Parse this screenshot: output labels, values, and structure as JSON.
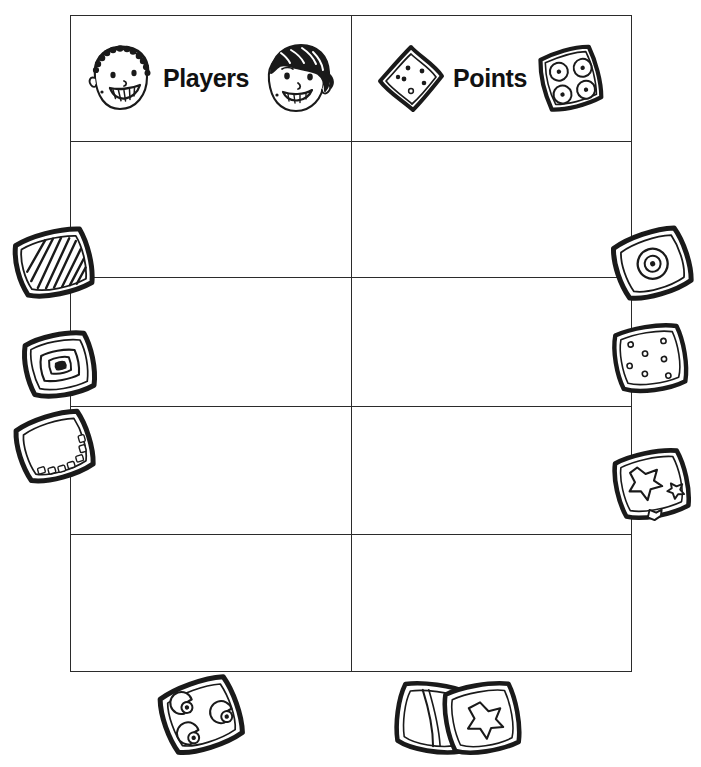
{
  "document": {
    "type": "worksheet",
    "title": "Players and Points score chart",
    "background_color": "#ffffff",
    "ink_color": "#1a1a1a"
  },
  "table": {
    "columns": [
      {
        "key": "players",
        "label": "Players",
        "left_icon": "boy-face-icon",
        "right_icon": "girl-face-icon"
      },
      {
        "key": "points",
        "label": "Points",
        "left_icon": "dotted-cracker-icon",
        "right_icon": "circles-cookie-icon"
      }
    ],
    "header_row_height_px": 125,
    "body_row_count": 4,
    "rows": [
      {
        "players": "",
        "points": ""
      },
      {
        "players": "",
        "points": ""
      },
      {
        "players": "",
        "points": ""
      },
      {
        "players": "",
        "points": ""
      }
    ]
  },
  "decorations": {
    "left": [
      {
        "name": "striped-cookie",
        "description": "square cookie with diagonal stripes"
      },
      {
        "name": "square-center-cookie",
        "description": "cookie with concentric square center"
      },
      {
        "name": "plain-edge-cookie",
        "description": "plain cookie with dotted edge"
      }
    ],
    "right": [
      {
        "name": "bullseye-cookie",
        "description": "cookie with concentric circle center"
      },
      {
        "name": "seven-dot-cracker",
        "description": "cracker with seven small dots"
      },
      {
        "name": "star-cutout-cracker",
        "description": "cracker with star cut-outs"
      }
    ],
    "bottom": [
      {
        "name": "spiral-dots-cookie",
        "description": "cookie with spiral swirl dots"
      },
      {
        "name": "overlapping-cookies",
        "description": "two overlapping cookies, one plain and one with a star"
      }
    ]
  }
}
